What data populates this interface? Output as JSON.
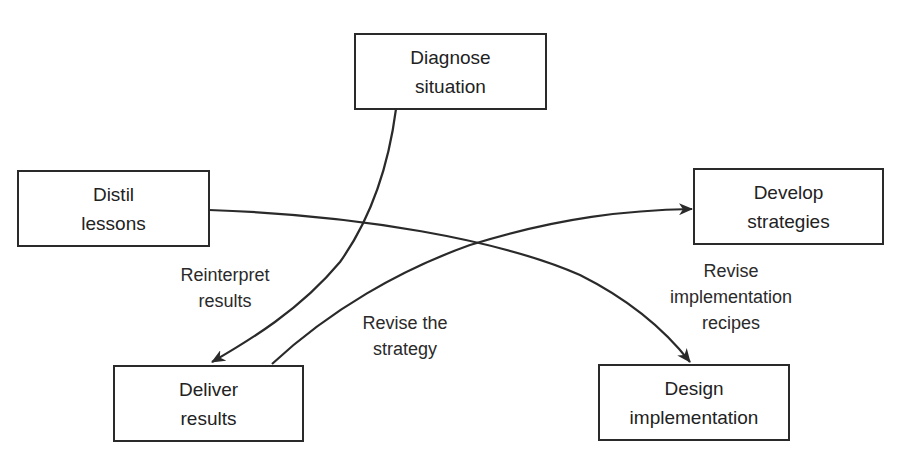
{
  "diagram": {
    "nodes": [
      {
        "id": "diagnose",
        "line1": "Diagnose",
        "line2": "situation"
      },
      {
        "id": "distil",
        "line1": "Distil",
        "line2": "lessons"
      },
      {
        "id": "develop",
        "line1": "Develop",
        "line2": "strategies"
      },
      {
        "id": "deliver",
        "line1": "Deliver",
        "line2": "results"
      },
      {
        "id": "design",
        "line1": "Design",
        "line2": "implementation"
      }
    ],
    "edges": [
      {
        "from": "diagnose",
        "to": "deliver",
        "line1": "Reinterpret",
        "line2": "results"
      },
      {
        "from": "deliver",
        "to": "develop",
        "line1": "Revise the",
        "line2": "strategy"
      },
      {
        "from": "distil",
        "to": "design",
        "line1": "Revise",
        "line2": "implementation",
        "line3": "recipes"
      }
    ],
    "colors": {
      "stroke": "#2a2a2a",
      "background": "#ffffff"
    }
  }
}
